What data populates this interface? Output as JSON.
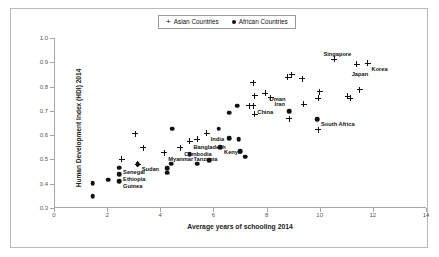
{
  "chart_data": {
    "type": "scatter",
    "title": "",
    "xlabel": "Average years of schooling 2014",
    "ylabel": "Human Development Index (HDI) 2014",
    "xlim": [
      0,
      14
    ],
    "ylim": [
      0.3,
      1.0
    ],
    "xticks": [
      "0",
      "2",
      "4",
      "6",
      "8",
      "10",
      "12",
      "14"
    ],
    "xtick_values": [
      0,
      2,
      4,
      6,
      8,
      10,
      12,
      14
    ],
    "yticks": [
      "0.3",
      "0.4",
      "0.5",
      "0.6",
      "0.7",
      "0.8",
      "0.9",
      "1.0"
    ],
    "ytick_values": [
      0.3,
      0.4,
      0.5,
      0.6,
      0.7,
      0.8,
      0.9,
      1.0
    ],
    "grid": false,
    "legend_position": "top-center",
    "legend": [
      {
        "name": "Asian Countries",
        "marker": "plus",
        "color": "#111111"
      },
      {
        "name": "African Countries",
        "marker": "filled-circle",
        "color": "#111111"
      }
    ],
    "series": [
      {
        "name": "Asian Countries",
        "marker": "plus",
        "points": [
          {
            "x": 3.05,
            "y": 0.605,
            "label": ""
          },
          {
            "x": 3.35,
            "y": 0.548,
            "label": ""
          },
          {
            "x": 2.55,
            "y": 0.502,
            "label": ""
          },
          {
            "x": 3.15,
            "y": 0.481,
            "label": ""
          },
          {
            "x": 4.15,
            "y": 0.527,
            "label": "Myanmar",
            "label_pos": "right"
          },
          {
            "x": 4.75,
            "y": 0.548,
            "label": "Cambodia",
            "label_pos": "right"
          },
          {
            "x": 5.1,
            "y": 0.575,
            "label": "Bangladesh",
            "label_pos": "right"
          },
          {
            "x": 5.4,
            "y": 0.583,
            "label": ""
          },
          {
            "x": 5.75,
            "y": 0.609,
            "label": "India",
            "label_pos": "right"
          },
          {
            "x": 7.35,
            "y": 0.722,
            "label": ""
          },
          {
            "x": 7.5,
            "y": 0.722,
            "label": "China",
            "label_pos": "right"
          },
          {
            "x": 7.55,
            "y": 0.686,
            "label": ""
          },
          {
            "x": 7.5,
            "y": 0.816,
            "label": ""
          },
          {
            "x": 7.55,
            "y": 0.762,
            "label": ""
          },
          {
            "x": 7.95,
            "y": 0.773,
            "label": "Oman",
            "label_pos": "right"
          },
          {
            "x": 8.15,
            "y": 0.755,
            "label": "Iran",
            "label_pos": "right"
          },
          {
            "x": 8.8,
            "y": 0.839,
            "label": ""
          },
          {
            "x": 8.95,
            "y": 0.849,
            "label": ""
          },
          {
            "x": 9.35,
            "y": 0.833,
            "label": ""
          },
          {
            "x": 9.4,
            "y": 0.727,
            "label": ""
          },
          {
            "x": 8.85,
            "y": 0.667,
            "label": ""
          },
          {
            "x": 9.95,
            "y": 0.622,
            "label": ""
          },
          {
            "x": 9.95,
            "y": 0.751,
            "label": ""
          },
          {
            "x": 10.0,
            "y": 0.779,
            "label": ""
          },
          {
            "x": 10.55,
            "y": 0.913,
            "label": "Singapore",
            "label_pos": "above"
          },
          {
            "x": 11.05,
            "y": 0.76,
            "label": ""
          },
          {
            "x": 11.15,
            "y": 0.753,
            "label": ""
          },
          {
            "x": 11.4,
            "y": 0.893,
            "label": "Japan",
            "label_pos": "below"
          },
          {
            "x": 11.5,
            "y": 0.787,
            "label": ""
          },
          {
            "x": 11.8,
            "y": 0.896,
            "label": "Korea",
            "label_pos": "right"
          }
        ]
      },
      {
        "name": "African Countries",
        "marker": "filled-circle",
        "points": [
          {
            "x": 1.45,
            "y": 0.401,
            "label": ""
          },
          {
            "x": 1.45,
            "y": 0.349,
            "label": ""
          },
          {
            "x": 2.05,
            "y": 0.417,
            "label": ""
          },
          {
            "x": 2.45,
            "y": 0.466,
            "label": "Senegal",
            "label_pos": "right"
          },
          {
            "x": 2.45,
            "y": 0.44,
            "label": "Ethiopia",
            "label_pos": "right"
          },
          {
            "x": 2.45,
            "y": 0.41,
            "label": "Guinea",
            "label_pos": "right"
          },
          {
            "x": 3.15,
            "y": 0.481,
            "label": "Sudan",
            "label_pos": "right"
          },
          {
            "x": 4.25,
            "y": 0.463,
            "label": ""
          },
          {
            "x": 4.25,
            "y": 0.445,
            "label": ""
          },
          {
            "x": 4.4,
            "y": 0.483,
            "label": ""
          },
          {
            "x": 4.45,
            "y": 0.627,
            "label": ""
          },
          {
            "x": 5.1,
            "y": 0.521,
            "label": "Tanzania",
            "label_pos": "right"
          },
          {
            "x": 5.4,
            "y": 0.483,
            "label": ""
          },
          {
            "x": 5.85,
            "y": 0.497,
            "label": ""
          },
          {
            "x": 6.2,
            "y": 0.627,
            "label": ""
          },
          {
            "x": 6.25,
            "y": 0.551,
            "label": "Kenya",
            "label_pos": "right"
          },
          {
            "x": 6.6,
            "y": 0.588,
            "label": ""
          },
          {
            "x": 6.6,
            "y": 0.692,
            "label": ""
          },
          {
            "x": 6.9,
            "y": 0.722,
            "label": ""
          },
          {
            "x": 6.95,
            "y": 0.583,
            "label": ""
          },
          {
            "x": 7.0,
            "y": 0.533,
            "label": ""
          },
          {
            "x": 7.2,
            "y": 0.511,
            "label": ""
          },
          {
            "x": 8.85,
            "y": 0.699,
            "label": ""
          },
          {
            "x": 9.9,
            "y": 0.665,
            "label": "South Africa",
            "label_pos": "right"
          }
        ]
      }
    ]
  }
}
